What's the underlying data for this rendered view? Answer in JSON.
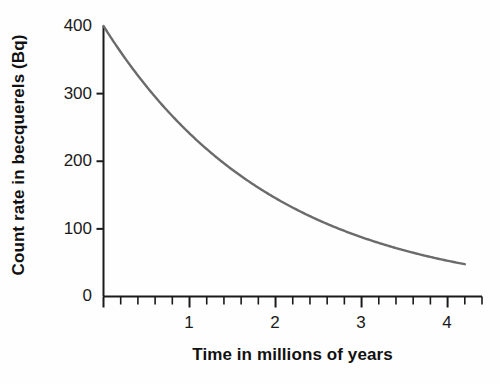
{
  "chart_data": {
    "type": "line",
    "title": "",
    "xlabel": "Time in millions of years",
    "ylabel": "Count rate in becquerels (Bq)",
    "xlim": [
      0,
      4.4
    ],
    "ylim": [
      0,
      400
    ],
    "grid": false,
    "legend": "none",
    "line_color": "#6b6b6b",
    "axis_color": "#1a1a1a",
    "background_color": "#fefefe",
    "xticks_major": [
      0,
      1,
      2,
      3,
      4
    ],
    "xtick_labels": [
      "0",
      "1",
      "2",
      "3",
      "4"
    ],
    "xticks_minor_step": 0.2,
    "yticks": [
      0,
      100,
      200,
      300,
      400
    ],
    "ytick_labels": [
      "0",
      "100",
      "200",
      "300",
      "400"
    ],
    "series": [
      {
        "name": "count rate",
        "description": "exponential radioactive decay",
        "initial_value": 400,
        "half_life": 1.37,
        "x": [
          0,
          0.2,
          0.4,
          0.6,
          0.8,
          1.0,
          1.2,
          1.4,
          1.6,
          1.8,
          2.0,
          2.2,
          2.4,
          2.6,
          2.8,
          3.0,
          3.2,
          3.4,
          3.6,
          3.8,
          4.0,
          4.2
        ],
        "values": [
          400,
          361,
          327,
          295,
          267,
          241,
          218,
          197,
          178,
          161,
          145,
          131,
          119,
          107,
          97,
          88,
          79,
          71,
          64,
          58,
          53,
          48
        ]
      }
    ]
  },
  "axes": {
    "y_title": "Count rate in becquerels (Bq)",
    "x_title": "Time in millions of years"
  },
  "y_ticks": [
    {
      "label": "400",
      "value": 400
    },
    {
      "label": "300",
      "value": 300
    },
    {
      "label": "200",
      "value": 200
    },
    {
      "label": "100",
      "value": 100
    },
    {
      "label": "0",
      "value": 0
    }
  ],
  "x_ticks": [
    {
      "label": "1",
      "value": 1
    },
    {
      "label": "2",
      "value": 2
    },
    {
      "label": "3",
      "value": 3
    },
    {
      "label": "4",
      "value": 4
    }
  ]
}
